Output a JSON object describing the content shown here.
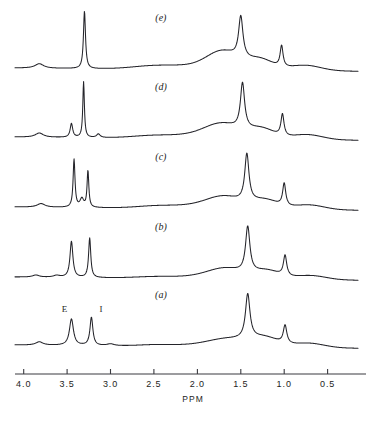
{
  "figure": {
    "background": "#ffffff",
    "stroke_color": "#24242a",
    "axis_color": "#3a3a40"
  },
  "axis": {
    "title": "PPM",
    "direction": "reversed",
    "xlim": [
      4.1,
      0.15
    ],
    "tick_values": [
      4.0,
      3.5,
      3.0,
      2.5,
      2.0,
      1.5,
      1.0,
      0.5
    ],
    "tick_labels": [
      "4.0",
      "3.5",
      "3.0",
      "2.5",
      "2.0",
      "1.5",
      "1.0",
      "0.5"
    ]
  },
  "peak_annotations": [
    {
      "text": "E",
      "ppm": 3.53,
      "trace": "a"
    },
    {
      "text": "I",
      "ppm": 3.11,
      "trace": "a"
    }
  ],
  "traces": [
    {
      "id": "e",
      "label": "(e)",
      "label_ppm": 2.42,
      "baseline_px": 68
    },
    {
      "id": "d",
      "label": "(d)",
      "label_ppm": 2.42,
      "baseline_px": 137
    },
    {
      "id": "c",
      "label": "(c)",
      "label_ppm": 2.42,
      "baseline_px": 207
    },
    {
      "id": "b",
      "label": "(b)",
      "label_ppm": 2.42,
      "baseline_px": 277
    },
    {
      "id": "a",
      "label": "(a)",
      "label_ppm": 2.42,
      "baseline_px": 345
    }
  ],
  "chart_data": {
    "type": "line",
    "title": "",
    "subtitle": "",
    "xlabel": "PPM",
    "ylabel": "",
    "xlim": [
      4.1,
      0.15
    ],
    "x_reversed": true,
    "grid": false,
    "legend": "none",
    "annotations": [
      {
        "text": "E",
        "x": 3.53,
        "series": "a"
      },
      {
        "text": "I",
        "x": 3.11,
        "series": "a"
      },
      {
        "text": "(a)",
        "x": 2.42,
        "series": "a"
      },
      {
        "text": "(b)",
        "x": 2.42,
        "series": "b"
      },
      {
        "text": "(c)",
        "x": 2.42,
        "series": "c"
      },
      {
        "text": "(d)",
        "x": 2.42,
        "series": "d"
      },
      {
        "text": "(e)",
        "x": 2.42,
        "series": "e"
      }
    ],
    "series": [
      {
        "name": "a",
        "stack_order": 1,
        "baseline_drift": {
          "left": 0.0,
          "right": -0.055
        },
        "peaks": [
          {
            "ppm": 3.82,
            "height": 0.055,
            "width": 0.1,
            "shape": "lorentz"
          },
          {
            "ppm": 3.45,
            "height": 0.44,
            "width": 0.055,
            "shape": "lorentz"
          },
          {
            "ppm": 3.22,
            "height": 0.47,
            "width": 0.04,
            "shape": "lorentz"
          },
          {
            "ppm": 3.0,
            "height": 0.03,
            "width": 0.1,
            "shape": "lorentz"
          },
          {
            "ppm": 2.45,
            "height": 0.028,
            "width": 0.22,
            "shape": "gauss"
          },
          {
            "ppm": 1.95,
            "height": 0.03,
            "width": 0.22,
            "shape": "gauss"
          },
          {
            "ppm": 1.62,
            "height": 0.13,
            "width": 0.22,
            "shape": "gauss"
          },
          {
            "ppm": 1.42,
            "height": 0.74,
            "width": 0.062,
            "shape": "lorentz"
          },
          {
            "ppm": 1.22,
            "height": 0.15,
            "width": 0.16,
            "shape": "gauss"
          },
          {
            "ppm": 0.99,
            "height": 0.3,
            "width": 0.048,
            "shape": "lorentz"
          },
          {
            "ppm": 0.72,
            "height": 0.075,
            "width": 0.18,
            "shape": "gauss"
          }
        ]
      },
      {
        "name": "b",
        "stack_order": 2,
        "baseline_drift": {
          "left": 0.0,
          "right": -0.055
        },
        "peaks": [
          {
            "ppm": 3.86,
            "height": 0.035,
            "width": 0.09,
            "shape": "lorentz"
          },
          {
            "ppm": 3.62,
            "height": 0.03,
            "width": 0.09,
            "shape": "lorentz"
          },
          {
            "ppm": 3.45,
            "height": 0.6,
            "width": 0.04,
            "shape": "lorentz"
          },
          {
            "ppm": 3.24,
            "height": 0.66,
            "width": 0.03,
            "shape": "lorentz"
          },
          {
            "ppm": 2.45,
            "height": 0.03,
            "width": 0.25,
            "shape": "gauss"
          },
          {
            "ppm": 1.95,
            "height": 0.035,
            "width": 0.22,
            "shape": "gauss"
          },
          {
            "ppm": 1.66,
            "height": 0.165,
            "width": 0.2,
            "shape": "gauss"
          },
          {
            "ppm": 1.42,
            "height": 0.76,
            "width": 0.06,
            "shape": "lorentz"
          },
          {
            "ppm": 1.2,
            "height": 0.14,
            "width": 0.15,
            "shape": "gauss"
          },
          {
            "ppm": 0.99,
            "height": 0.34,
            "width": 0.045,
            "shape": "lorentz"
          },
          {
            "ppm": 0.7,
            "height": 0.07,
            "width": 0.18,
            "shape": "gauss"
          }
        ]
      },
      {
        "name": "c",
        "stack_order": 3,
        "baseline_drift": {
          "left": 0.0,
          "right": -0.055
        },
        "peaks": [
          {
            "ppm": 3.8,
            "height": 0.06,
            "width": 0.11,
            "shape": "lorentz"
          },
          {
            "ppm": 3.42,
            "height": 0.8,
            "width": 0.026,
            "shape": "lorentz"
          },
          {
            "ppm": 3.33,
            "height": 0.14,
            "width": 0.05,
            "shape": "lorentz"
          },
          {
            "ppm": 3.26,
            "height": 0.61,
            "width": 0.024,
            "shape": "lorentz"
          },
          {
            "ppm": 2.45,
            "height": 0.042,
            "width": 0.24,
            "shape": "gauss"
          },
          {
            "ppm": 1.98,
            "height": 0.048,
            "width": 0.24,
            "shape": "gauss"
          },
          {
            "ppm": 1.68,
            "height": 0.19,
            "width": 0.2,
            "shape": "gauss"
          },
          {
            "ppm": 1.43,
            "height": 0.79,
            "width": 0.058,
            "shape": "lorentz"
          },
          {
            "ppm": 1.22,
            "height": 0.15,
            "width": 0.15,
            "shape": "gauss"
          },
          {
            "ppm": 1.0,
            "height": 0.37,
            "width": 0.042,
            "shape": "lorentz"
          },
          {
            "ppm": 0.72,
            "height": 0.08,
            "width": 0.18,
            "shape": "gauss"
          }
        ]
      },
      {
        "name": "d",
        "stack_order": 4,
        "baseline_drift": {
          "left": 0.0,
          "right": -0.055
        },
        "peaks": [
          {
            "ppm": 3.82,
            "height": 0.07,
            "width": 0.11,
            "shape": "lorentz"
          },
          {
            "ppm": 3.45,
            "height": 0.23,
            "width": 0.035,
            "shape": "lorentz"
          },
          {
            "ppm": 3.31,
            "height": 0.93,
            "width": 0.022,
            "shape": "lorentz"
          },
          {
            "ppm": 3.14,
            "height": 0.06,
            "width": 0.05,
            "shape": "lorentz"
          },
          {
            "ppm": 2.48,
            "height": 0.048,
            "width": 0.26,
            "shape": "gauss"
          },
          {
            "ppm": 1.98,
            "height": 0.055,
            "width": 0.24,
            "shape": "gauss"
          },
          {
            "ppm": 1.7,
            "height": 0.23,
            "width": 0.2,
            "shape": "gauss"
          },
          {
            "ppm": 1.48,
            "height": 0.76,
            "width": 0.058,
            "shape": "lorentz"
          },
          {
            "ppm": 1.26,
            "height": 0.17,
            "width": 0.15,
            "shape": "gauss"
          },
          {
            "ppm": 1.02,
            "height": 0.36,
            "width": 0.042,
            "shape": "lorentz"
          },
          {
            "ppm": 0.74,
            "height": 0.085,
            "width": 0.18,
            "shape": "gauss"
          }
        ]
      },
      {
        "name": "e",
        "stack_order": 5,
        "baseline_drift": {
          "left": 0.0,
          "right": -0.055
        },
        "peaks": [
          {
            "ppm": 3.82,
            "height": 0.075,
            "width": 0.12,
            "shape": "lorentz"
          },
          {
            "ppm": 3.3,
            "height": 0.96,
            "width": 0.028,
            "shape": "lorentz"
          },
          {
            "ppm": 2.48,
            "height": 0.06,
            "width": 0.26,
            "shape": "gauss"
          },
          {
            "ppm": 2.0,
            "height": 0.055,
            "width": 0.24,
            "shape": "gauss"
          },
          {
            "ppm": 1.7,
            "height": 0.29,
            "width": 0.18,
            "shape": "gauss"
          },
          {
            "ppm": 1.5,
            "height": 0.69,
            "width": 0.06,
            "shape": "lorentz"
          },
          {
            "ppm": 1.28,
            "height": 0.18,
            "width": 0.15,
            "shape": "gauss"
          },
          {
            "ppm": 1.03,
            "height": 0.35,
            "width": 0.04,
            "shape": "lorentz"
          },
          {
            "ppm": 0.76,
            "height": 0.09,
            "width": 0.18,
            "shape": "gauss"
          }
        ]
      }
    ]
  },
  "geometry": {
    "plot_left_px": 15,
    "plot_right_px": 358,
    "ppm_at_left": 4.1,
    "ppm_at_right": 0.15,
    "axis_y_px": 374,
    "tick_height_px": 5,
    "tick_label_y_px": 387,
    "axis_title_y_px": 402,
    "axis_title_x_px": 193,
    "trace_amplitude_px": 60
  }
}
